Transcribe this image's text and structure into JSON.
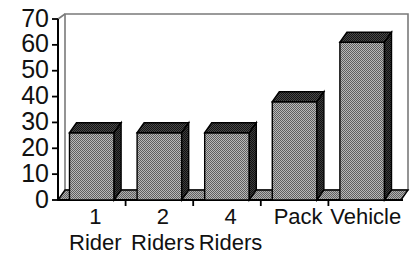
{
  "chart_data": {
    "type": "bar",
    "title": "",
    "subtitle": "",
    "xlabel": "",
    "ylabel": "",
    "categories": [
      "1 Rider",
      "2 Riders",
      "4 Riders",
      "Pack",
      "Vehicle"
    ],
    "category_lines": [
      [
        "1",
        "Rider"
      ],
      [
        "2",
        "Riders"
      ],
      [
        "4",
        "Riders"
      ],
      [
        "Pack",
        ""
      ],
      [
        "Vehicle",
        ""
      ]
    ],
    "values": [
      26,
      26,
      26,
      38,
      61
    ],
    "ylim": [
      0,
      70
    ],
    "ytick_labels": [
      "0",
      "10",
      "20",
      "30",
      "40",
      "50",
      "60",
      "70"
    ],
    "ytick_values": [
      0,
      10,
      20,
      30,
      40,
      50,
      60,
      70
    ],
    "grid": false,
    "legend": "none",
    "style": "3d-bar",
    "colors": {
      "bar_front": "#8c8c8c",
      "bar_top": "#3a3a3a",
      "bar_side": "#2e2e2e",
      "floor": "#8c8c8c",
      "axis": "#000000",
      "frame": "#7a7a7a",
      "background": "#ffffff",
      "text": "#111111"
    }
  }
}
